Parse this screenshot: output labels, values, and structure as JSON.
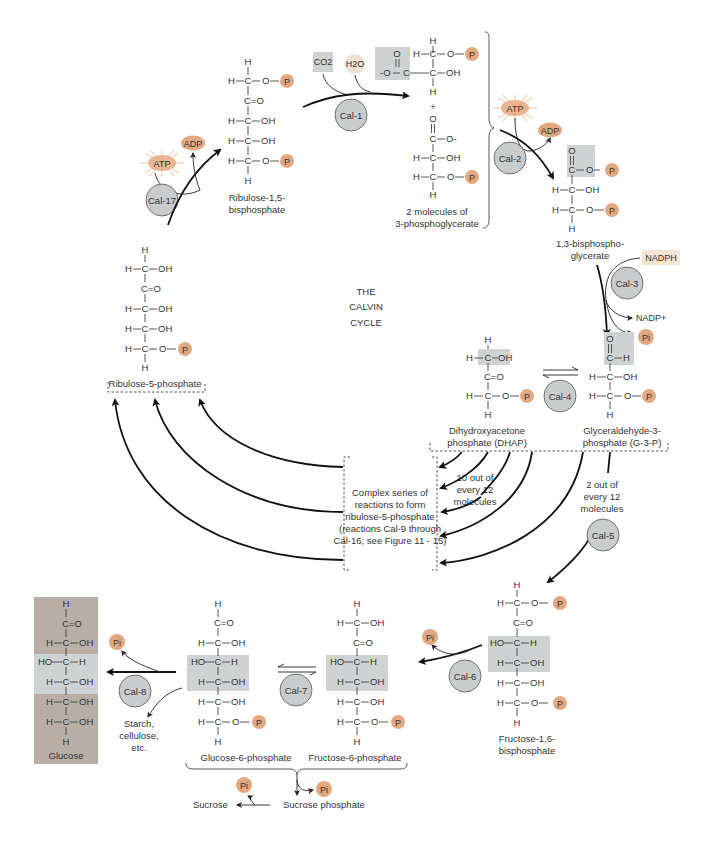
{
  "title": "THE CALVIN CYCLE",
  "title_lines": [
    "THE",
    "CALVIN",
    "CYCLE"
  ],
  "colors": {
    "phosphate": "#e2a882",
    "atp_burst": "#e9b48f",
    "h2o": "#f1e1d2",
    "enzyme": "#c9cccd",
    "highlight_box": "#cfd2d3",
    "glucose_bg": "#b9aea6",
    "nadph_bg": "#f3e4d6",
    "arrow": "#111111"
  },
  "labels": {
    "phosphate": "P",
    "pi": "Pi",
    "atp": "ATP",
    "adp": "ADP",
    "co2": "CO2",
    "h2o": "H2O",
    "nadph": "NADPH",
    "nadp": "NADP+",
    "plus": "+"
  },
  "enzymes": {
    "cal1": "Cal-1",
    "cal2": "Cal-2",
    "cal3": "Cal-3",
    "cal4": "Cal-4",
    "cal5": "Cal-5",
    "cal6": "Cal-6",
    "cal7": "Cal-7",
    "cal8": "Cal-8",
    "cal17": "Cal-17"
  },
  "molecules": {
    "rubp": [
      "Ribulose-1,5-",
      "bisphosphate"
    ],
    "pga": [
      "2 molecules of",
      "3-phosphoglycerate"
    ],
    "bpg": [
      "1,3-bisphospho-",
      "glycerate"
    ],
    "dhap": [
      "Dihydroxyacetone",
      "phosphate (DHAP)"
    ],
    "g3p": [
      "Glyceraldehyde-3-",
      "phosphate (G-3-P)"
    ],
    "r5p": "Ribulose-5-phosphate",
    "fbp": [
      "Fructose-1,6-",
      "bisphosphate"
    ],
    "f6p": "Fructose-6-phosphate",
    "g6p": "Glucose-6-phosphate",
    "glucose": "Glucose",
    "sucrose": "Sucrose",
    "sucrose_phosphate": "Sucrose phosphate",
    "starch": [
      "Starch,",
      "cellulose,",
      "etc."
    ]
  },
  "annotations": {
    "ten_of_twelve": [
      "10 out of",
      "every 12",
      "molecules"
    ],
    "two_of_twelve": [
      "2 out of",
      "every 12",
      "molecules"
    ],
    "complex_series": [
      "Complex series of",
      "reactions to form",
      "ribulose-5-phosphate",
      "(reactions Cal-9 through",
      "Cal-16; see Figure 11 - 15)"
    ]
  },
  "atoms": {
    "H": "H",
    "C": "C",
    "O": "O",
    "OH": "OH",
    "HO": "HO",
    "CO": "C=O",
    "Ominus": "-O",
    "Ominus_r": "O-"
  }
}
